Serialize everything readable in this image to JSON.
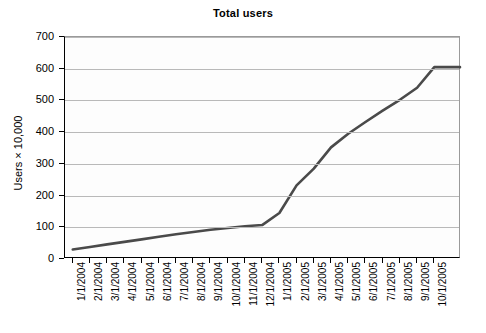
{
  "chart_data": {
    "type": "line",
    "title": "Total users",
    "xlabel": "",
    "ylabel": "Users × 10,000",
    "ylim": [
      0,
      700
    ],
    "y_ticks": [
      0,
      100,
      200,
      300,
      400,
      500,
      600,
      700
    ],
    "grid": true,
    "legend": false,
    "legend_position": "none",
    "line_color": "#4a4a4a",
    "categories": [
      "1/1/2004",
      "2/1/2004",
      "3/1/2004",
      "4/1/2004",
      "5/1/2004",
      "6/1/2004",
      "7/1/2004",
      "8/1/2004",
      "9/1/2004",
      "10/1/2004",
      "11/1/2004",
      "12/1/2004",
      "1/1/2005",
      "2/1/2005",
      "3/1/2005",
      "4/1/2005",
      "5/1/2005",
      "6/1/2005",
      "7/1/2005",
      "8/1/2005",
      "9/1/2005",
      "10/1/2005"
    ],
    "series": [
      {
        "name": "Total users",
        "values": [
          30,
          38,
          46,
          54,
          62,
          70,
          78,
          85,
          92,
          98,
          103,
          107,
          145,
          232,
          285,
          352,
          395,
          432,
          468,
          502,
          540,
          605
        ]
      }
    ]
  }
}
